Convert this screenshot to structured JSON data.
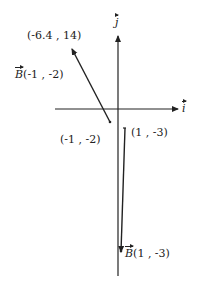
{
  "axes": {
    "x_label": "i",
    "y_label": "j"
  },
  "vectors": [
    {
      "name": "B",
      "label_text": "(-1 , -2)",
      "start_label": "(-1 , -2)",
      "end_label": "(-6.4 , 14)"
    },
    {
      "name": "B",
      "label_text": "(1 , -3)",
      "start_label": "(1 , -3)"
    }
  ],
  "colors": {
    "stroke": "#222222",
    "background": "#ffffff"
  }
}
